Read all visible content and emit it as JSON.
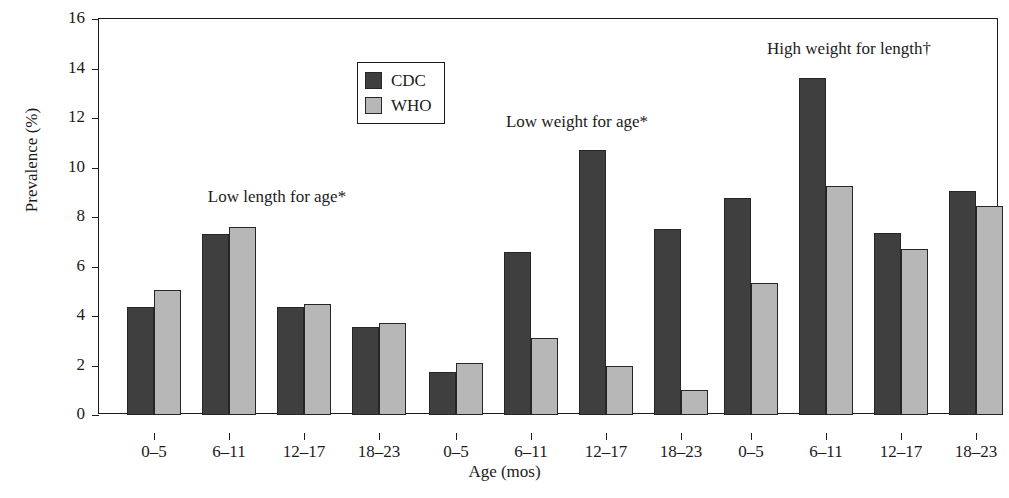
{
  "chart_data": {
    "type": "bar",
    "title": "",
    "xlabel": "Age (mos)",
    "ylabel": "Prevalence (%)",
    "ylim": [
      0,
      16
    ],
    "ytick_values": [
      0,
      2,
      4,
      6,
      8,
      10,
      12,
      14,
      16
    ],
    "ytick_labels": [
      "0",
      "2",
      "4",
      "6",
      "8",
      "10",
      "12",
      "14",
      "16"
    ],
    "grid": false,
    "legend_position": "top-left-inside",
    "legend": [
      "CDC",
      "WHO"
    ],
    "categories": [
      "0–5",
      "6–11",
      "12–17",
      "18–23"
    ],
    "panel_annotations": [
      "Low length for age*",
      "Low weight for age*",
      "High weight for length†"
    ],
    "groups": [
      {
        "name": "Low length for age*",
        "categories": [
          "0–5",
          "6–11",
          "12–17",
          "18–23"
        ],
        "series": [
          {
            "name": "CDC",
            "values": [
              4.35,
              7.3,
              4.35,
              3.55
            ]
          },
          {
            "name": "WHO",
            "values": [
              5.05,
              7.6,
              4.5,
              3.7
            ]
          }
        ]
      },
      {
        "name": "Low weight for age*",
        "categories": [
          "0–5",
          "6–11",
          "12–17",
          "18–23"
        ],
        "series": [
          {
            "name": "CDC",
            "values": [
              1.75,
              6.6,
              10.7,
              7.5
            ]
          },
          {
            "name": "WHO",
            "values": [
              2.1,
              3.1,
              2.0,
              1.0
            ]
          }
        ]
      },
      {
        "name": "High weight for length†",
        "categories": [
          "0–5",
          "6–11",
          "12–17",
          "18–23"
        ],
        "series": [
          {
            "name": "CDC",
            "values": [
              8.75,
              13.6,
              7.35,
              9.05
            ]
          },
          {
            "name": "WHO",
            "values": [
              5.35,
              9.25,
              6.7,
              8.45
            ]
          }
        ]
      }
    ],
    "colors": {
      "cdc": "#3f3f3f",
      "who": "#b7b7b7",
      "outline": "#262626",
      "axis": "#1b1b1b",
      "background": "#ffffff"
    }
  },
  "annotation_positions": [
    {
      "label": "Low length for age*",
      "x": 276,
      "y": 186
    },
    {
      "label": "Low weight for age*",
      "x": 576,
      "y": 111
    },
    {
      "label": "High weight for length†",
      "x": 848,
      "y": 38
    }
  ],
  "legend": {
    "items": [
      {
        "label": "CDC",
        "swatch": "cdc"
      },
      {
        "label": "WHO",
        "swatch": "who"
      }
    ]
  },
  "axes": {
    "y_title": "Prevalence (%)",
    "x_title": "Age (mos)"
  }
}
